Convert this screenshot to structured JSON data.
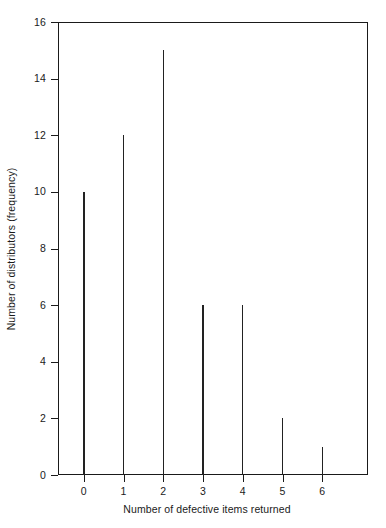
{
  "chart_data": {
    "type": "bar",
    "title": "",
    "subtitle": "",
    "xlabel": "Number of defective items returned",
    "ylabel": "Number of distributors (frequency)",
    "categories": [
      "0",
      "1",
      "2",
      "3",
      "4",
      "5",
      "6"
    ],
    "values": [
      10,
      12,
      15,
      6,
      6,
      2,
      1
    ],
    "series": [
      {
        "name": "frequency",
        "values": [
          10,
          12,
          15,
          6,
          6,
          2,
          1
        ]
      }
    ],
    "xlim": [
      -0.65,
      7.15
    ],
    "ylim": [
      0,
      16
    ],
    "ytick_labels": [
      "0",
      "2",
      "4",
      "6",
      "8",
      "10",
      "12",
      "14",
      "16"
    ],
    "ytick_values": [
      0,
      2,
      4,
      6,
      8,
      10,
      12,
      14,
      16
    ],
    "xtick_labels": [
      "0",
      "1",
      "2",
      "3",
      "4",
      "5",
      "6"
    ],
    "xtick_values": [
      0,
      1,
      2,
      3,
      4,
      5,
      6
    ],
    "grid": false,
    "legend": null,
    "legend_position": "none",
    "annotations": [],
    "style": {
      "line_color": "#222222",
      "axis_color": "#1a1a1a",
      "background": "#ffffff",
      "bar_width_px": 1.4
    }
  }
}
